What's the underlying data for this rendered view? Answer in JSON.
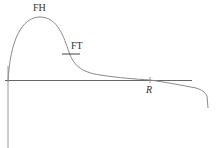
{
  "diagram": {
    "type": "curve-diagram",
    "labels": {
      "peak": "FH",
      "tangent_point": "FT",
      "crossing": "R"
    },
    "colors": {
      "curve": "#8a8a8a",
      "axis": "#555555",
      "label": "#333333"
    }
  }
}
